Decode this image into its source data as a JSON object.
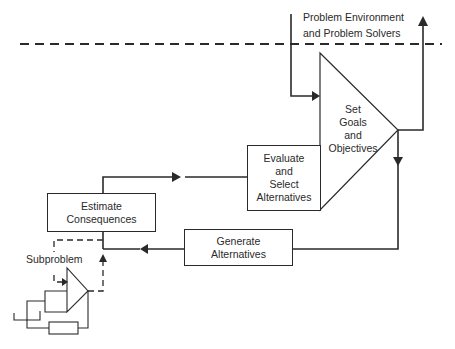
{
  "diagram": {
    "environment_label_line1": "Problem Environment",
    "environment_label_line2": "and Problem Solvers",
    "set_goals": [
      "Set",
      "Goals",
      "and",
      "Objectives"
    ],
    "evaluate": [
      "Evaluate",
      "and",
      "Select",
      "Alternatives"
    ],
    "estimate": [
      "Estimate",
      "Consequences"
    ],
    "generate": [
      "Generate",
      "Alternatives"
    ],
    "subproblem_label": "Subproblem",
    "line_color": "#2a2a2a"
  }
}
